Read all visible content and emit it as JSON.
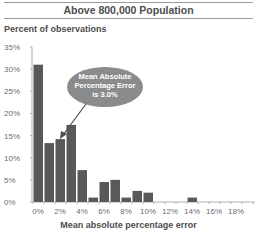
{
  "header": {
    "title": "Above 800,000 Population"
  },
  "chart_data": {
    "type": "bar",
    "title": "Above 800,000 Population",
    "ylabel": "Percent of observations",
    "xlabel": "Mean absolute percentage error",
    "ylim": [
      0,
      35
    ],
    "yticks": [
      "0%",
      "5%",
      "10%",
      "15%",
      "20%",
      "25%",
      "30%",
      "35%"
    ],
    "xticks": [
      "0%",
      "2%",
      "4%",
      "6%",
      "8%",
      "10%",
      "12%",
      "14%",
      "16%",
      "18%"
    ],
    "categories": [
      "0-1%",
      "1-2%",
      "2-3%",
      "3-4%",
      "4-5%",
      "5-6%",
      "6-7%",
      "7-8%",
      "8-9%",
      "9-10%",
      "10-11%",
      "11-12%",
      "12-13%",
      "13-14%",
      "14-15%",
      "15-16%",
      "16-17%",
      "17-18%",
      "18-19%",
      "19-20%"
    ],
    "values": [
      31,
      13.3,
      14.2,
      17.4,
      7.2,
      1,
      4.5,
      5,
      1,
      2.5,
      2.1,
      0,
      0,
      0,
      1,
      0,
      0,
      0,
      0,
      0
    ],
    "grid": false,
    "bar_color": "#58595b",
    "annotation": {
      "lines": [
        "Mean Absolute",
        "Percentage Error",
        "is 3.0%"
      ],
      "points_to": "2-3%",
      "bubble_color": "#8a8b8d"
    }
  }
}
